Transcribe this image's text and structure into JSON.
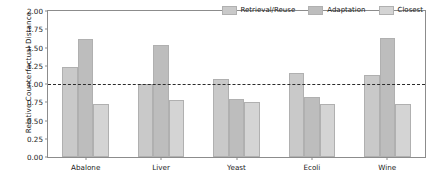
{
  "chart_data": {
    "type": "bar",
    "title": "",
    "xlabel": "",
    "ylabel": "Relative Counterfactual Distance",
    "categories": [
      "Abalone",
      "Liver",
      "Yeast",
      "Ecoli",
      "Wine"
    ],
    "series": [
      {
        "name": "Retrieval/Reuse",
        "color": "#c9c9c9",
        "values": [
          1.23,
          1.0,
          1.07,
          1.15,
          1.13
        ]
      },
      {
        "name": "Adaptation",
        "color": "#bdbdbd",
        "values": [
          1.62,
          1.54,
          0.8,
          0.82,
          1.63
        ]
      },
      {
        "name": "Closest",
        "color": "#d4d4d4",
        "values": [
          0.72,
          0.78,
          0.76,
          0.72,
          0.72
        ]
      }
    ],
    "ylim": [
      0.0,
      2.0
    ],
    "yticks": [
      "0.00",
      "0.25",
      "0.50",
      "0.75",
      "1.00",
      "1.25",
      "1.50",
      "1.75",
      "2.00"
    ],
    "ytick_values": [
      0.0,
      0.25,
      0.5,
      0.75,
      1.0,
      1.25,
      1.5,
      1.75,
      2.0
    ],
    "grid": false,
    "legend_position": "upper right",
    "reference_line": {
      "value": 1.0,
      "style": "dashed",
      "color": "#2b2b2b"
    },
    "bar_edge_color": "#b0b0b0",
    "axis_color": "#8c8c8c",
    "background": "#ffffff"
  },
  "legend": {
    "entries": [
      {
        "label": "Retrieval/Reuse"
      },
      {
        "label": "Adaptation"
      },
      {
        "label": "Closest"
      }
    ]
  }
}
